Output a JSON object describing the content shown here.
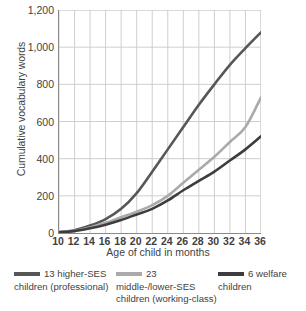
{
  "chart_data": {
    "type": "line",
    "title": "",
    "xlabel": "Age of child in months",
    "ylabel": "Cumulative vocabulary words",
    "xlim": [
      10,
      36
    ],
    "ylim": [
      0,
      1200
    ],
    "grid": true,
    "legend_position": "bottom",
    "x_ticks": [
      "10",
      "12",
      "14",
      "16",
      "18",
      "20",
      "22",
      "24",
      "26",
      "28",
      "30",
      "32",
      "34",
      "36"
    ],
    "y_ticks": [
      "0",
      "200",
      "400",
      "600",
      "800",
      "1,000",
      "1,200"
    ],
    "x": [
      10,
      12,
      14,
      16,
      18,
      20,
      22,
      24,
      26,
      28,
      30,
      32,
      34,
      36
    ],
    "series": [
      {
        "name": "13 higher-SES children (professional)",
        "color": "#575757",
        "values": [
          5,
          15,
          40,
          75,
          130,
          215,
          330,
          450,
          570,
          690,
          800,
          905,
          995,
          1080
        ]
      },
      {
        "name": "23 middle-/lower-SES children (working-class)",
        "color": "#aaaaaa",
        "values": [
          5,
          12,
          30,
          55,
          85,
          115,
          150,
          200,
          270,
          340,
          410,
          490,
          570,
          730
        ]
      },
      {
        "name": "6 welfare children",
        "color": "#3d3d3d",
        "values": [
          4,
          10,
          25,
          45,
          70,
          100,
          130,
          175,
          230,
          280,
          330,
          390,
          450,
          520
        ]
      }
    ]
  },
  "legend": {
    "items": [
      {
        "swatch_name": "legend-swatch-higher-ses",
        "label": "13 higher-SES children (professional)",
        "color": "#575757"
      },
      {
        "swatch_name": "legend-swatch-middle-lower-ses",
        "label": "23 middle-/lower-SES children (working-class)",
        "color": "#aaaaaa"
      },
      {
        "swatch_name": "legend-swatch-welfare",
        "label": "6 welfare children",
        "color": "#3d3d3d"
      }
    ]
  },
  "colors": {
    "grid": "#c9c9c9",
    "axis": "#8a8a8a",
    "text": "#3f3f3f",
    "background": "#ffffff"
  }
}
